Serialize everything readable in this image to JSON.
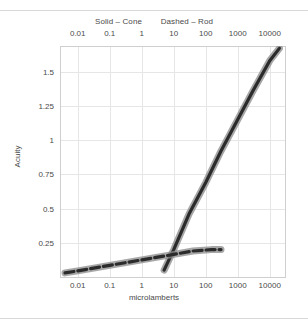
{
  "chart_data": {
    "type": "line",
    "title": "",
    "xlabel": "microlamberts",
    "ylabel": "Acuity",
    "xscale": "log",
    "xlim": [
      0.003,
      30000
    ],
    "ylim": [
      0,
      1.68
    ],
    "grid": true,
    "legend_position": "top",
    "top_axis": true,
    "xticks": [
      0.01,
      0.1,
      1,
      10,
      100,
      1000,
      10000
    ],
    "xtick_labels": [
      "0.01",
      "0.1",
      "1",
      "10",
      "100",
      "1000",
      "10000"
    ],
    "yticks": [
      0.25,
      0.5,
      0.75,
      1,
      1.25,
      1.5
    ],
    "ytick_labels": [
      "0.25",
      "0.5",
      "0.75",
      "1",
      "1.25",
      "1.5"
    ],
    "series": [
      {
        "name": "Cone",
        "style": "solid",
        "legend_label": "Solid – Cone",
        "color": "#2b2b2b",
        "x": [
          5,
          10,
          30,
          100,
          300,
          1000,
          3000,
          10000,
          20000
        ],
        "y": [
          0.05,
          0.2,
          0.46,
          0.69,
          0.92,
          1.15,
          1.36,
          1.58,
          1.67
        ]
      },
      {
        "name": "Rod",
        "style": "dashed",
        "legend_label": "Dashed – Rod",
        "color": "#2b2b2b",
        "x": [
          0.004,
          0.01,
          0.1,
          1,
          10,
          40,
          150,
          300
        ],
        "y": [
          0.03,
          0.045,
          0.085,
          0.125,
          0.165,
          0.19,
          0.2,
          0.2
        ]
      }
    ]
  },
  "legend": {
    "solid_entry": "Solid – Cone",
    "dashed_entry": "Dashed – Rod"
  },
  "axes": {
    "x_title": "microlamberts",
    "y_title": "Acuity"
  },
  "colors": {
    "line_core": "#2b2b2b",
    "line_halo": "#8a8a8a",
    "grid": "#e6e6e6",
    "frame": "#cfcfcf",
    "rule": "#d8d8d8",
    "text": "#4a4a4a",
    "background": "#ffffff"
  }
}
